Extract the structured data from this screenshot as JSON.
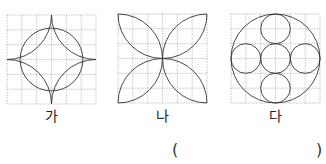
{
  "figures": [
    {
      "id": "ga",
      "label": "가",
      "description": "6x6 grid with inscribed circle (radius 2 cells) and four-pointed star formed by quarter arcs centered at the square's corners"
    },
    {
      "id": "na",
      "label": "나",
      "description": "6x6 grid with four leaf shapes, each bounded by two quarter arcs meeting at a corner and the center"
    },
    {
      "id": "da",
      "label": "다",
      "description": "6x6 grid with a large circle (radius 3 cells) containing five small circles (radius 1 cell) in a plus arrangement"
    }
  ],
  "answer_blank": {
    "open": "(",
    "close": ")"
  },
  "colors": {
    "grid": "#9a9a9a",
    "stroke": "#333333"
  }
}
